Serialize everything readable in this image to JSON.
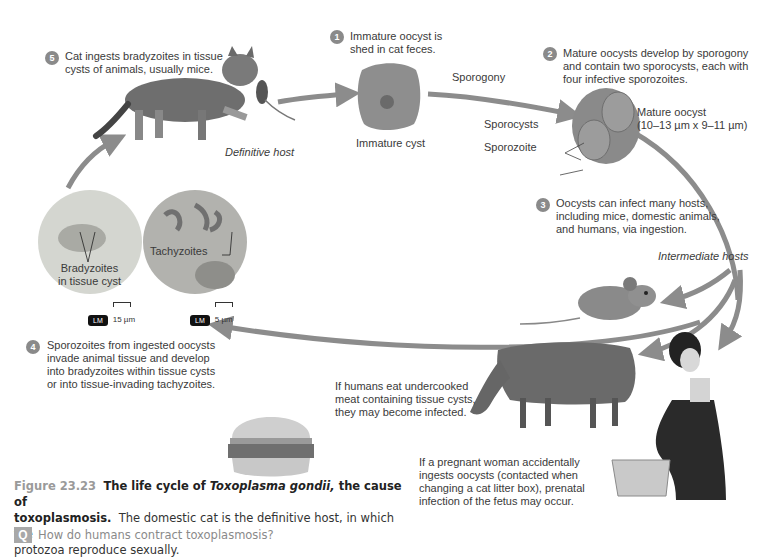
{
  "steps": [
    {
      "num": "1",
      "text_lines": [
        "Immature oocyst is",
        "shed in cat feces."
      ]
    },
    {
      "num": "2",
      "text_lines": [
        "Mature oocysts develop by sporogony",
        "and contain two sporocysts, each with",
        "four infective sporozoites."
      ]
    },
    {
      "num": "3",
      "text_lines": [
        "Oocysts can infect many hosts,",
        "including mice, domestic animals,",
        "and humans, via ingestion."
      ]
    },
    {
      "num": "4",
      "text_lines": [
        "Sporozoites from ingested oocysts",
        "invade animal tissue and develop",
        "into bradyzoites within tissue cysts",
        "or into tissue-invading tachyzoites."
      ]
    },
    {
      "num": "5",
      "text_lines": [
        "Cat ingests bradyzoites in tissue",
        "cysts of animals, usually mice."
      ]
    }
  ],
  "labels": {
    "definitive_host": "Definitive host",
    "immature_cyst": "Immature cyst",
    "sporogony": "Sporogony",
    "sporocysts": "Sporocysts",
    "sporozoite": "Sporozoite",
    "mature_oocyst_line1": "Mature oocyst",
    "mature_oocyst_line2": "(10–13 µm x 9–11 µm)",
    "intermediate_hosts": "Intermediate hosts",
    "bradyzoites_line1": "Bradyzoites",
    "bradyzoites_line2": "in tissue cyst",
    "tachyzoites": "Tachyzoites",
    "lm1": "LM",
    "scale1": "15 µm",
    "lm2": "LM",
    "scale2": "5 µm"
  },
  "notes": {
    "meat_lines": [
      "If humans eat undercooked",
      "meat containing tissue cysts,",
      "they may become infected."
    ],
    "pregnant_lines": [
      "If a pregnant woman accidentally",
      "ingests oocysts (contacted when",
      "changing a cat litter box), prenatal",
      "infection of the fetus may occur."
    ]
  },
  "caption": {
    "figure_number": "Figure 23.23",
    "title_pre": "The life cycle of ",
    "title_italic": "Toxoplasma gondii,",
    "title_post": " the cause of",
    "title_line2": "toxoplasmosis.",
    "body_line1": "The domestic cat is the definitive host, in which the",
    "body_line2": "protozoa reproduce sexually.",
    "question_icon": "Q",
    "question": "How do humans contract toxoplasmosis?"
  },
  "colors": {
    "arrow": "#8c8c8c",
    "badge": "#8a8a8a",
    "figure_number": "#9a9a9a"
  }
}
